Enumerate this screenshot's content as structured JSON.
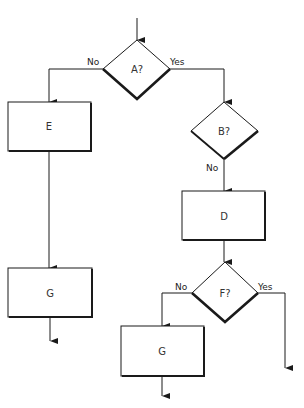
{
  "diagram": {
    "type": "flowchart",
    "nodes": {
      "A": {
        "label": "A?",
        "shape": "decision"
      },
      "B": {
        "label": "B?",
        "shape": "decision"
      },
      "D": {
        "label": "D",
        "shape": "process"
      },
      "E": {
        "label": "E",
        "shape": "process"
      },
      "F": {
        "label": "F?",
        "shape": "decision"
      },
      "G1": {
        "label": "G",
        "shape": "process"
      },
      "G2": {
        "label": "G",
        "shape": "process"
      }
    },
    "edges": {
      "a_no": {
        "label": "No",
        "from": "A",
        "to": "E"
      },
      "a_yes": {
        "label": "Yes",
        "from": "A",
        "to": "B"
      },
      "b_no": {
        "label": "No",
        "from": "B",
        "to": "D"
      },
      "f_no": {
        "label": "No",
        "from": "F",
        "to": "G2"
      },
      "f_yes": {
        "label": "Yes",
        "from": "F",
        "to": "exit"
      }
    },
    "colors": {
      "stroke": "#1a1a1a",
      "background": "#ffffff"
    }
  }
}
